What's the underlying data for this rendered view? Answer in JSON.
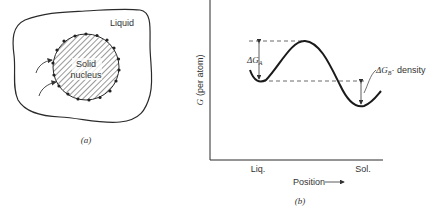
{
  "panel_a": {
    "region_label": "Liquid",
    "nucleus_label_line1": "Solid",
    "nucleus_label_line2": "nucleus",
    "caption": "(a)"
  },
  "panel_b": {
    "y_axis_label": "G  (per  atom)",
    "x_axis_label": "Position",
    "x_tick_left": "Liq.",
    "x_tick_right": "Sol.",
    "delta_a_label": "ΔG",
    "delta_a_sub": "A",
    "delta_b_label": "ΔG",
    "delta_b_sub": "B",
    "delta_b_suffix": "· density",
    "caption": "(b)"
  },
  "colors": {
    "ink": "#2a2a2a",
    "background": "#ffffff"
  }
}
